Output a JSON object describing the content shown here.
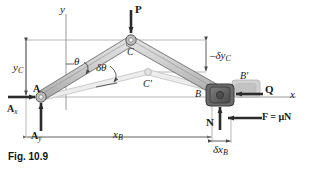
{
  "figure": {
    "caption": "Fig. 10.9",
    "axes": {
      "x_label": "x",
      "y_label": "y"
    },
    "points": {
      "A": "A",
      "C": "C",
      "C_displaced": "C'",
      "B": "B",
      "B_displaced": "B'"
    },
    "forces": {
      "P": "P",
      "Q": "Q",
      "N": "N",
      "friction": "F = μN",
      "reaction_x": "A",
      "reaction_x_sub": "x",
      "reaction_y": "A",
      "reaction_y_sub": "y"
    },
    "dimensions": {
      "y_C": "y",
      "y_C_sub": "C",
      "x_B": "x",
      "x_B_sub": "B",
      "delta_y_C": "–δy",
      "delta_y_C_sub": "C",
      "delta_x_B": "δx",
      "delta_x_B_sub": "B"
    },
    "angles": {
      "theta": "θ",
      "delta_theta": "δθ"
    },
    "colors": {
      "ink": "#1a1a1a",
      "arrow": "#2b2b2b",
      "link_fill": "#c9c9c9",
      "link_edge": "#6e6e6e",
      "ghost": "#b9b9b9",
      "block_dark": "#5d5d5d",
      "block_light": "#b3b3b3",
      "dimline": "#8c8c8c"
    }
  }
}
